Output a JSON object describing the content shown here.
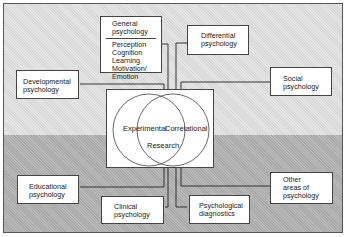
{
  "diagram": {
    "center": {
      "circles": [
        "Experimental",
        "Correlational"
      ],
      "overlap_label": "Research"
    },
    "boxes": {
      "general": {
        "title_line1": "General",
        "title_line2": "psychology",
        "items": [
          "Perception",
          "Cognition",
          "Learning",
          "Motivation/",
          "Emotion"
        ]
      },
      "differential": {
        "line1": "Differential",
        "line2": "psychology"
      },
      "developmental": {
        "line1": "Developmental",
        "line2": "psychology"
      },
      "social": {
        "line1": "Social",
        "line2": "psychology"
      },
      "educational": {
        "line1": "Educational",
        "line2": "psychology"
      },
      "clinical": {
        "line1": "Clinical",
        "line2": "psychology"
      },
      "diagnostics": {
        "line1": "Psychological",
        "line2": "diagnostics"
      },
      "other": {
        "line1": "Other",
        "line2": "areas of",
        "line3": "psychology"
      }
    },
    "colors": {
      "top_background": "#d8d8d8",
      "bottom_background": "#a9a9a9",
      "box_fill": "#ffffff",
      "line": "#333333"
    }
  }
}
